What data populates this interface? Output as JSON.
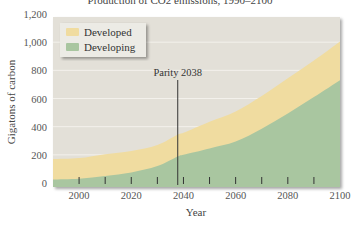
{
  "chart_data": {
    "type": "area",
    "stacked": true,
    "title": "Production of CO2 emissions, 1990–2100",
    "xlabel": "Year",
    "ylabel": "Gigatons of carbon",
    "x": [
      1990,
      2000,
      2010,
      2020,
      2030,
      2038,
      2040,
      2050,
      2060,
      2070,
      2080,
      2090,
      2100
    ],
    "series": [
      {
        "name": "Developing",
        "color": "#a9c6a0",
        "values": [
          25,
          30,
          50,
          75,
          120,
          190,
          200,
          245,
          294,
          385,
          493,
          610,
          730
        ]
      },
      {
        "name": "Developed",
        "color": "#f0dca0",
        "values": [
          145,
          147,
          155,
          153,
          150,
          156,
          156,
          190,
          214,
          232,
          250,
          260,
          275
        ]
      }
    ],
    "totals": [
      170,
      177,
      205,
      228,
      270,
      346,
      356,
      435,
      508,
      617,
      743,
      870,
      1005
    ],
    "xlim": [
      1990,
      2100
    ],
    "ylim": [
      0,
      1200
    ],
    "yticks": [
      "0",
      "200",
      "400",
      "600",
      "800",
      "1,000",
      "1,200"
    ],
    "xticks": [
      "2000",
      "2020",
      "2040",
      "2060",
      "2080",
      "2100"
    ],
    "grid": true,
    "legend_position": "upper-left",
    "legend": [
      "Developed",
      "Developing"
    ],
    "annotations": [
      {
        "text": "Parity 2038",
        "x": 2038
      }
    ]
  },
  "colors": {
    "plot_bg": "#e3e0d8",
    "legend_bg": "#ecebe5",
    "developed": "#f0dca0",
    "developing": "#a9c6a0",
    "gridline": "#f3f1ec"
  }
}
